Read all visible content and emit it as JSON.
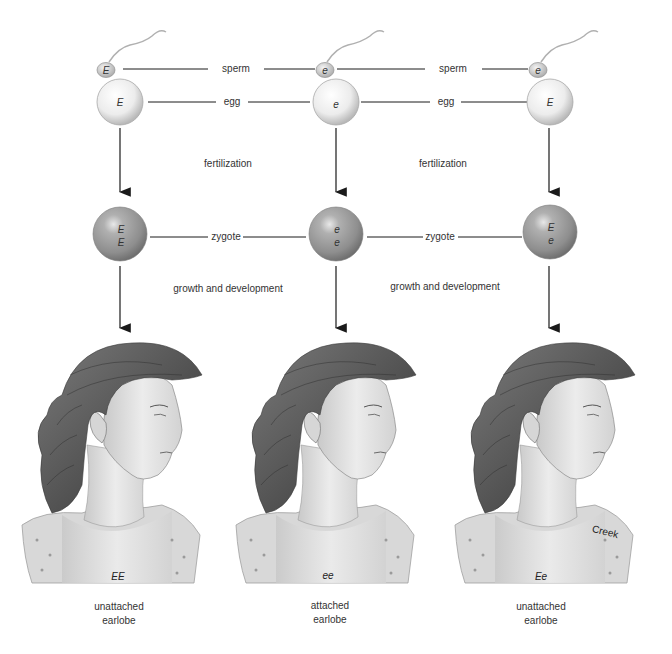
{
  "diagram": {
    "type": "genetic inheritance of earlobe attachment",
    "row_labels": {
      "sperm": "sperm",
      "egg": "egg",
      "fertilization": "fertilization",
      "zygote": "zygote",
      "growth": "growth and development"
    },
    "columns": [
      {
        "sperm_allele": "E",
        "egg_allele": "E",
        "zygote_alleles": [
          "E",
          "E"
        ],
        "genotype": "EE",
        "phenotype_line1": "unattached",
        "phenotype_line2": "earlobe"
      },
      {
        "sperm_allele": "e",
        "egg_allele": "e",
        "zygote_alleles": [
          "e",
          "e"
        ],
        "genotype": "ee",
        "phenotype_line1": "attached",
        "phenotype_line2": "earlobe"
      },
      {
        "sperm_allele": "e",
        "egg_allele": "E",
        "zygote_alleles": [
          "E",
          "e"
        ],
        "genotype": "Ee",
        "phenotype_line1": "unattached",
        "phenotype_line2": "earlobe"
      }
    ],
    "signature": "Creek",
    "colors": {
      "egg_fill": "#f2f2f2",
      "zygote_fill": "#9a9a9a",
      "line": "#1a1a1a",
      "hair": "#5a5a5a",
      "skin": "#e4e4e4"
    }
  }
}
